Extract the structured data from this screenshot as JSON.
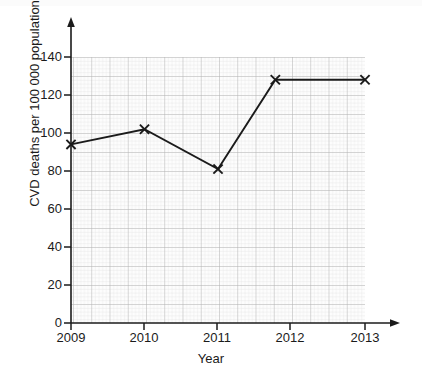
{
  "chart_data": {
    "type": "line",
    "title": "",
    "subtitle": "",
    "xlabel": "Year",
    "ylabel": "CVD deaths per 100 000 population",
    "x": [
      2009,
      2010,
      2011,
      2011.78,
      2013
    ],
    "values": [
      94,
      102,
      81,
      128,
      128
    ],
    "series": [
      {
        "name": "CVD deaths",
        "x": [
          2009,
          2010,
          2011,
          2011.78,
          2013
        ],
        "values": [
          94,
          102,
          81,
          128,
          128
        ]
      }
    ],
    "xlim": [
      2009,
      2013
    ],
    "ylim": [
      0,
      148
    ],
    "xticks": [
      2009,
      2010,
      2011,
      2012,
      2013
    ],
    "xtick_labels": [
      "2009",
      "2010",
      "2011",
      "2012",
      "2013"
    ],
    "yticks": [
      0,
      20,
      40,
      60,
      80,
      100,
      120,
      140
    ],
    "ytick_labels": [
      "0",
      "20",
      "40",
      "60",
      "80",
      "100",
      "120",
      "140"
    ],
    "grid": true,
    "grid_style": "graph-paper",
    "legend": "none",
    "marker": "x",
    "line_color": "#1b1b1b",
    "grid_minor_color": "#d8d8d8",
    "grid_major_color": "#b4b4b4",
    "axis_color": "#1b1b1b",
    "plot_background": "#fcfcfc"
  },
  "axes": {
    "y_title": "CVD deaths per 100 000 population",
    "x_title": "Year"
  }
}
